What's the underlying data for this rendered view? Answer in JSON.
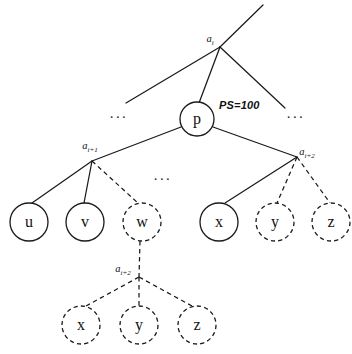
{
  "diagram": {
    "colors": {
      "ink": "#1a1a1a",
      "background": "#ffffff"
    },
    "root_anchor": {
      "base": "a",
      "subscript": "i",
      "full": "a i"
    },
    "pivot_node": {
      "label": "p",
      "style": "solid"
    },
    "ps_annotation": {
      "text": "PS=100"
    },
    "ellipsis": {
      "left": "...",
      "right": "...",
      "middle": "..."
    },
    "left_anchor": {
      "base": "a",
      "subscript": "i+1",
      "full": "a i+1"
    },
    "right_anchor": {
      "base": "a",
      "subscript": "i+2",
      "full": "a i+2"
    },
    "sub_anchor": {
      "base": "a",
      "subscript": "i+2",
      "full": "a i+2"
    },
    "left_children": [
      {
        "label": "u",
        "style": "solid"
      },
      {
        "label": "v",
        "style": "solid"
      },
      {
        "label": "w",
        "style": "dashed"
      }
    ],
    "right_children": [
      {
        "label": "x",
        "style": "solid"
      },
      {
        "label": "y",
        "style": "dashed"
      },
      {
        "label": "z",
        "style": "dashed"
      }
    ],
    "sub_children": [
      {
        "label": "x",
        "style": "dashed"
      },
      {
        "label": "y",
        "style": "dashed"
      },
      {
        "label": "z",
        "style": "dashed"
      }
    ]
  }
}
